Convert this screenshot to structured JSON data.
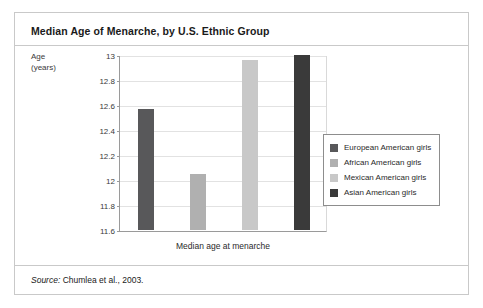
{
  "figure": {
    "title": "Median Age of Menarche, by U.S. Ethnic Group",
    "source_prefix": "Source:",
    "source_text": "Chumlea et al., 2003."
  },
  "axis_caption": {
    "line1": "Age",
    "line2": "(years)"
  },
  "chart_data": {
    "type": "bar",
    "title": "Median Age of Menarche, by U.S. Ethnic Group",
    "xlabel": "Median age at menarche",
    "ylabel": "Age (years)",
    "ylim": [
      11.6,
      13
    ],
    "yticks": [
      "11.6",
      "11.8",
      "12",
      "12.2",
      "12.4",
      "12.6",
      "12.8",
      "13"
    ],
    "ytick_values": [
      11.6,
      11.8,
      12,
      12.2,
      12.4,
      12.6,
      12.8,
      13
    ],
    "grid": true,
    "legend_position": "right",
    "categories": [
      "European American girls",
      "African American girls",
      "Mexican American girls",
      "Asian American girls"
    ],
    "values": [
      12.57,
      12.05,
      12.96,
      13.0
    ],
    "colors": [
      "#58585a",
      "#b0b0b0",
      "#c8c8c8",
      "#3a3a3a"
    ]
  },
  "legend": {
    "items": [
      {
        "label": "European American girls",
        "color": "#58585a"
      },
      {
        "label": "African American girls",
        "color": "#b0b0b0"
      },
      {
        "label": "Mexican American girls",
        "color": "#c8c8c8"
      },
      {
        "label": "Asian American girls",
        "color": "#3a3a3a"
      }
    ]
  }
}
